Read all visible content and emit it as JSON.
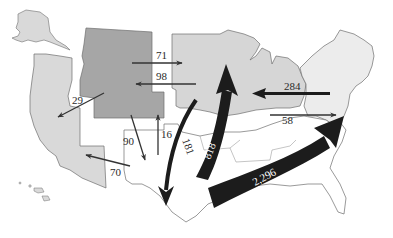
{
  "map": {
    "type": "flow-map",
    "subject": "Interregional flows between U.S. regions",
    "colors": {
      "west_region": "#d9d9d9",
      "mountain_region": "#a6a6a6",
      "midwest_region": "#d6d6d6",
      "northeast_region": "#ececec",
      "south_region": "#ffffff",
      "border": "#6e6e6e",
      "thin_arrow": "#333333",
      "thick_arrow": "#1c1c1c"
    },
    "flows": [
      {
        "id": "f71",
        "label": "71",
        "from": "Mountain",
        "to": "Midwest"
      },
      {
        "id": "f98",
        "label": "98",
        "from": "Midwest",
        "to": "Mountain"
      },
      {
        "id": "f29",
        "label": "29",
        "from": "Mountain",
        "to": "Pacific"
      },
      {
        "id": "f90",
        "label": "90",
        "from": "Mountain",
        "to": "South"
      },
      {
        "id": "f16",
        "label": "16",
        "from": "South",
        "to": "Mountain"
      },
      {
        "id": "f70",
        "label": "70",
        "from": "South",
        "to": "Pacific"
      },
      {
        "id": "f181",
        "label": "181",
        "from": "Midwest",
        "to": "South"
      },
      {
        "id": "f818",
        "label": "818",
        "from": "South",
        "to": "Midwest"
      },
      {
        "id": "f284",
        "label": "284",
        "from": "Northeast",
        "to": "Midwest"
      },
      {
        "id": "f58",
        "label": "58",
        "from": "Midwest",
        "to": "Northeast"
      },
      {
        "id": "f2296",
        "label": "2,296",
        "from": "South",
        "to": "Northeast"
      }
    ]
  }
}
